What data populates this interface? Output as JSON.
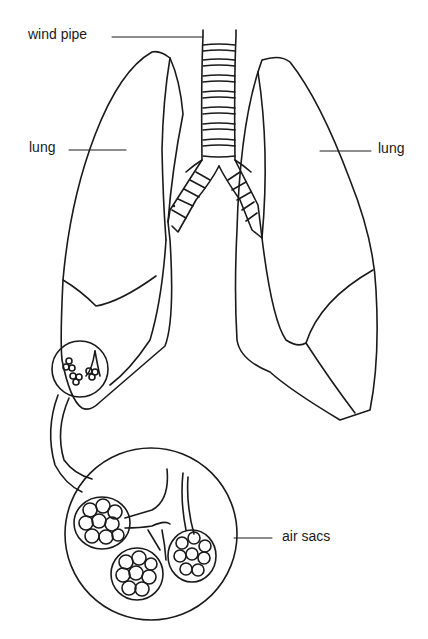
{
  "diagram": {
    "type": "anatomical-line-drawing",
    "labels": {
      "wind_pipe": "wind pipe",
      "lung_left": "lung",
      "lung_right": "lung",
      "air_sacs": "air sacs"
    },
    "colors": {
      "stroke": "#1a1a1a",
      "background": "#ffffff"
    }
  }
}
